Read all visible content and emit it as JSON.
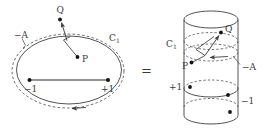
{
  "figure": {
    "name": "branch-cut-contour-equals-cylinder",
    "relation_symbol": "=",
    "stroke_color": "#4a4a4a",
    "label_color": "#3b3b3b",
    "dot_color": "#1a1a1a",
    "background": "#ffffff"
  },
  "left_panel": {
    "name": "plane-contour-diagram",
    "labels": {
      "minus_A": "−A",
      "contour_C": "C",
      "contour_C_sub": "1",
      "branch_left": "−1",
      "branch_right": "+1",
      "point_P": "P",
      "point_Q": "Q"
    },
    "curves": {
      "solid_ellipse": "solid-contour",
      "dashed_ellipse": "dashed-contour",
      "orientation_arrow": "counterclockwise-bottom-arrow"
    },
    "segment": {
      "name": "branch-cut-segment",
      "from": "−1",
      "to": "+1"
    }
  },
  "right_panel": {
    "name": "cylinder-diagram",
    "labels": {
      "contour_C": "C",
      "contour_C_sub": "1",
      "minus_A": "−A",
      "level_plus_1": "+1",
      "level_minus_1": "−1",
      "point_P": "P",
      "point_Q": "Q"
    },
    "curves": {
      "top_cap": "solid-ellipse-cap",
      "upper_dashed_ring": "dashed-ring-C1",
      "mid_ring": "ring-plus-1-minus-1",
      "bottom_cap": "solid-ellipse-cap",
      "orientation_arrow": "leftward-arrow-on-ring"
    }
  }
}
